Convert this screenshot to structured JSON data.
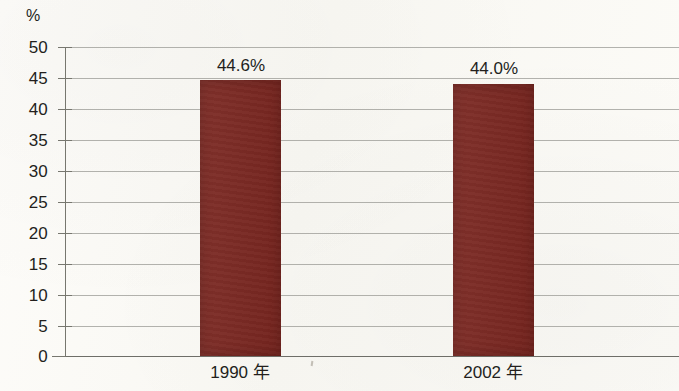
{
  "chart_data": {
    "type": "bar",
    "title": "",
    "subtitle": "",
    "xlabel": "",
    "ylabel": "%",
    "unit_label": "%",
    "categories": [
      "1990 年",
      "2002 年"
    ],
    "values": [
      44.6,
      44.0
    ],
    "value_labels": [
      "44.6%",
      "44.0%"
    ],
    "series": [
      {
        "name": "",
        "values": [
          44.6,
          44.0
        ],
        "color": "#7a2620"
      }
    ],
    "ylim": [
      0,
      50
    ],
    "y_ticks": [
      50,
      45,
      40,
      35,
      30,
      25,
      20,
      15,
      10,
      5,
      0
    ],
    "y_tick_labels": [
      "50",
      "45",
      "40",
      "35",
      "30",
      "25",
      "20",
      "15",
      "10",
      "5",
      "0"
    ],
    "grid": true,
    "grid_axis": "y",
    "legend": false,
    "legend_position": "none",
    "bar_color": "#7a2620",
    "background_color": "#fbfaf6",
    "grid_color": "#9a9a94",
    "axis_color": "#77776f",
    "text_color": "#231f1c",
    "annotations": []
  }
}
